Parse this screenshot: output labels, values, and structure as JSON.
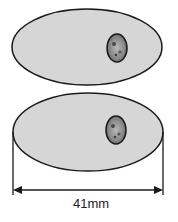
{
  "diagram": {
    "top_shape": {
      "ellipse": {
        "cx": 87,
        "cy": 47,
        "rx": 75,
        "ry": 38
      },
      "inclusion": {
        "cx": 117,
        "cy": 48,
        "rx": 10,
        "ry": 14
      }
    },
    "bottom_shape": {
      "ellipse": {
        "cx": 88,
        "cy": 132,
        "rx": 75,
        "ry": 39
      },
      "inclusion": {
        "cx": 116,
        "cy": 130,
        "rx": 10,
        "ry": 14
      }
    },
    "dimension": {
      "label": "41mm",
      "x1": 13,
      "x2": 163,
      "y": 190
    },
    "colors": {
      "fill": "#d6d6d6",
      "stroke": "#1a1a1a",
      "inclusion_fill": "#8f8f8f"
    }
  }
}
